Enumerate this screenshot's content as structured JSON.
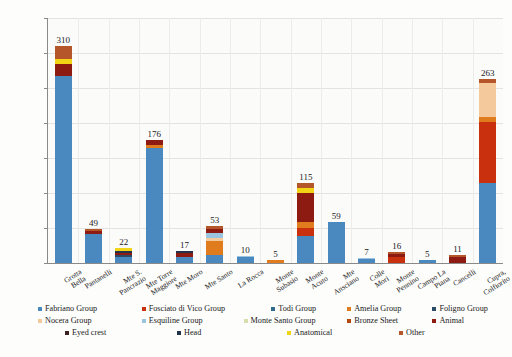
{
  "chart_data": {
    "type": "bar",
    "stacked": true,
    "title": "",
    "xlabel": "",
    "ylabel": "",
    "ylim": [
      0,
      350
    ],
    "ytick_step": 50,
    "yticks": [
      "0",
      "50",
      "100",
      "150",
      "200",
      "250",
      "300",
      "350"
    ],
    "grid": true,
    "legend_position": "bottom",
    "categories": [
      "Grotta Bella",
      "Pantanelli",
      "Mte S. Pancrazio",
      "Mte Torre Maggiore",
      "Mte Moro",
      "Mte Santo",
      "La Rocca",
      "Monte Subasio",
      "Monte Acuto",
      "Mte Ansciano",
      "Colle Mori",
      "Monte Pennino",
      "Campo La Piana",
      "Cancelli",
      "Cupra, Colfiorito"
    ],
    "totals": [
      310,
      49,
      22,
      176,
      17,
      53,
      10,
      5,
      115,
      59,
      7,
      16,
      5,
      11,
      263
    ],
    "series": [
      {
        "name": "Fabriano Group",
        "color": "#4a89bf",
        "values": [
          267,
          41,
          9,
          165,
          9,
          12,
          8,
          0,
          38,
          59,
          6,
          0,
          4,
          0,
          115
        ]
      },
      {
        "name": "Fosciato di Vico Group",
        "color": "#c9300e",
        "values": [
          0,
          0,
          0,
          0,
          0,
          0,
          0,
          0,
          12,
          0,
          0,
          8,
          0,
          0,
          87
        ]
      },
      {
        "name": "Todi Group",
        "color": "#2e6b8f",
        "values": [
          0,
          0,
          0,
          0,
          0,
          0,
          0,
          0,
          0,
          0,
          0,
          0,
          0,
          0,
          0
        ]
      },
      {
        "name": "Amelia Group",
        "color": "#e07b1e",
        "values": [
          0,
          0,
          0,
          4,
          0,
          20,
          0,
          4,
          8,
          0,
          0,
          0,
          0,
          0,
          7
        ]
      },
      {
        "name": "Foligno Group",
        "color": "#2a4a66",
        "values": [
          0,
          0,
          2,
          0,
          0,
          0,
          0,
          0,
          0,
          0,
          0,
          0,
          0,
          0,
          0
        ]
      },
      {
        "name": "Nocera Group",
        "color": "#f4c99b",
        "values": [
          0,
          0,
          0,
          0,
          0,
          4,
          0,
          0,
          0,
          0,
          0,
          0,
          0,
          0,
          48
        ]
      },
      {
        "name": "Esquiline Group",
        "color": "#9bc4e0",
        "values": [
          0,
          0,
          0,
          0,
          0,
          7,
          2,
          0,
          0,
          0,
          1,
          0,
          1,
          0,
          0
        ]
      },
      {
        "name": "Monte Santo Group",
        "color": "#d8ddb0",
        "values": [
          0,
          0,
          0,
          0,
          0,
          0,
          0,
          0,
          0,
          0,
          0,
          0,
          0,
          0,
          0
        ]
      },
      {
        "name": "Bronze Sheet",
        "color": "#b5470f",
        "values": [
          0,
          0,
          0,
          0,
          0,
          0,
          0,
          0,
          0,
          0,
          0,
          0,
          0,
          0,
          0
        ]
      },
      {
        "name": "Animal",
        "color": "#8e1b12",
        "values": [
          17,
          5,
          3,
          7,
          5,
          6,
          0,
          1,
          42,
          0,
          0,
          5,
          0,
          9,
          0
        ]
      },
      {
        "name": "Eyed crest",
        "color": "#3b2020",
        "values": [
          0,
          0,
          0,
          0,
          0,
          0,
          0,
          0,
          0,
          0,
          0,
          0,
          0,
          0,
          0
        ]
      },
      {
        "name": "Head",
        "color": "#22334a",
        "values": [
          0,
          0,
          3,
          0,
          3,
          0,
          0,
          0,
          0,
          0,
          0,
          0,
          0,
          0,
          0
        ]
      },
      {
        "name": "Anatomical",
        "color": "#f2d417",
        "values": [
          8,
          0,
          5,
          0,
          0,
          0,
          0,
          0,
          7,
          0,
          0,
          0,
          0,
          0,
          0
        ]
      },
      {
        "name": "Other",
        "color": "#b4562a",
        "values": [
          18,
          3,
          0,
          0,
          0,
          4,
          0,
          0,
          8,
          0,
          0,
          3,
          0,
          2,
          6
        ]
      }
    ]
  },
  "axis": {
    "y_labels": [
      "350",
      "300",
      "250",
      "200",
      "150",
      "100",
      "50",
      "0"
    ]
  },
  "bar_value_labels": [
    "310",
    "49",
    "22",
    "176",
    "17",
    "53",
    "10",
    "5",
    "115",
    "59",
    "7",
    "16",
    "5",
    "11",
    "263"
  ],
  "x_labels": [
    "Grotta\nBella",
    "Pantanelli",
    "Mte S.\nPancrazio",
    "Mte Torre\nMaggiore",
    "Mte Moro",
    "Mte Santo",
    "La Rocca",
    "Monte\nSubasio",
    "Monte\nAcuto",
    "Mte\nAnsciano",
    "Colle\nMori",
    "Monte\nPennino",
    "Campo La\nPiana",
    "Cancelli",
    "Cupra,\nColfiorito"
  ],
  "legend": {
    "items": [
      {
        "label": "Fabriano Group",
        "color": "#4a89bf"
      },
      {
        "label": "Fosciato di Vico Group",
        "color": "#c9300e"
      },
      {
        "label": "Todi Group",
        "color": "#2e6b8f"
      },
      {
        "label": "Amelia Group",
        "color": "#e07b1e"
      },
      {
        "label": "Foligno Group",
        "color": "#2a4a66"
      },
      {
        "label": "Nocera Group",
        "color": "#f4c99b"
      },
      {
        "label": "Esquiline Group",
        "color": "#9bc4e0"
      },
      {
        "label": "Monte Santo Group",
        "color": "#d8ddb0"
      },
      {
        "label": "Bronze Sheet",
        "color": "#b5470f"
      },
      {
        "label": "Animal",
        "color": "#8e1b12"
      },
      {
        "label": "Eyed crest",
        "color": "#3b2020"
      },
      {
        "label": "Head",
        "color": "#22334a"
      },
      {
        "label": "Anatomical",
        "color": "#f2d417"
      },
      {
        "label": "Other",
        "color": "#b4562a"
      }
    ]
  }
}
